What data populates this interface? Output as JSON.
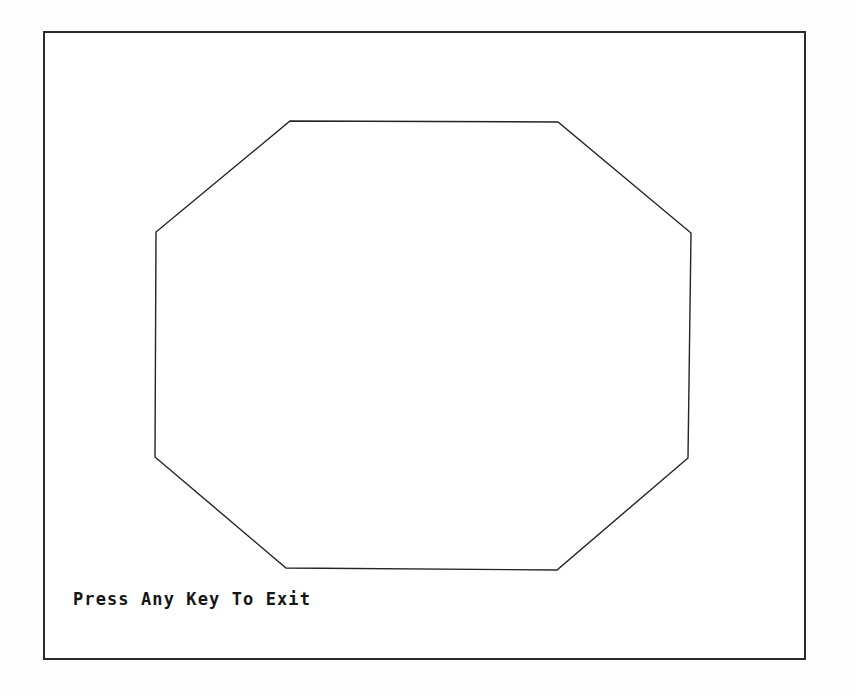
{
  "app": {
    "title": "Octagon Demo",
    "background_color": "#ffffff",
    "ink_color": "#242424"
  },
  "viewport": {
    "name": "graphics-viewport",
    "border_color": "#2b2b2b",
    "border_width_px": 2,
    "x": 43,
    "y": 31,
    "width": 763,
    "height": 629
  },
  "shape": {
    "kind": "octagon",
    "sides": 8,
    "stroke_color": "#242424",
    "fill": "none",
    "stroke_width_px": 1.4,
    "vertices": [
      [
        290,
        121
      ],
      [
        558,
        122
      ],
      [
        691,
        233
      ],
      [
        688,
        458
      ],
      [
        557,
        570
      ],
      [
        286,
        568
      ],
      [
        155,
        457
      ],
      [
        156,
        232
      ]
    ],
    "points_attr": "290,121 558,122 691,233 688,458 557,570 286,568 155,457 156,232"
  },
  "prompt": {
    "text": "Press Any Key To Exit",
    "x": 73,
    "y": 589,
    "color": "#151515"
  }
}
